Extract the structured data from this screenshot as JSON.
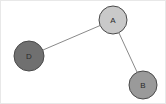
{
  "canvas": {
    "width": 166,
    "height": 104,
    "background_color": "#ffffff",
    "border_color": "#e8e8e8"
  },
  "chart_data": {
    "type": "diagram",
    "subtype": "node-link-graph",
    "title": "",
    "xlabel": "",
    "ylabel": "",
    "directed": false,
    "nodes": [
      {
        "id": "A",
        "label": "A",
        "x": 112,
        "y": 19,
        "r": 14,
        "fill": "#c9c9c9",
        "stroke": "#4a4a4a",
        "label_color": "#2a2a2a"
      },
      {
        "id": "B",
        "label": "B",
        "x": 142,
        "y": 84,
        "r": 14,
        "fill": "#9a9a9a",
        "stroke": "#4a4a4a",
        "label_color": "#2a2a2a"
      },
      {
        "id": "D",
        "label": "D",
        "x": 28,
        "y": 55,
        "r": 15,
        "fill": "#707070",
        "stroke": "#4a4a4a",
        "label_color": "#1f1f1f"
      }
    ],
    "edges": [
      {
        "source": "D",
        "target": "A",
        "stroke": "#8a8a8a",
        "width": 1
      },
      {
        "source": "A",
        "target": "B",
        "stroke": "#8a8a8a",
        "width": 1
      }
    ],
    "legend": [],
    "annotations": []
  }
}
